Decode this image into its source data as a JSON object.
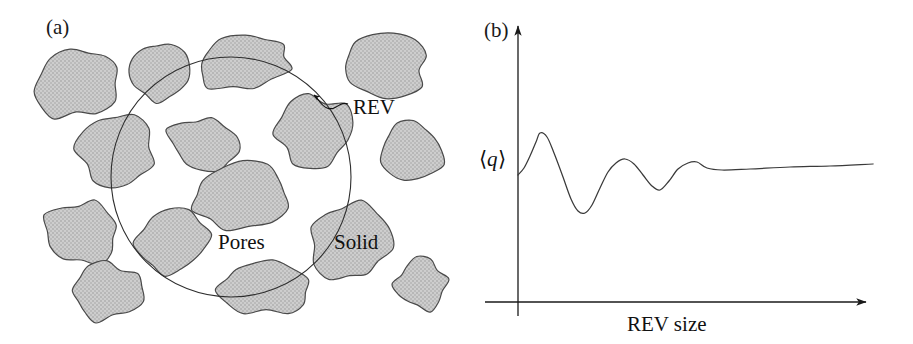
{
  "figure": {
    "background_color": "#ffffff",
    "ink_color": "#1a1a1a",
    "grain_fill_color": "#c9c9c9",
    "grain_stroke_color": "#4a4a4a"
  },
  "panel_a": {
    "label": "(a)",
    "annotations": {
      "rev": "REV",
      "pores": "Pores",
      "solid": "Solid"
    },
    "rev_circle": {
      "cx": 231,
      "cy": 177,
      "r": 120
    },
    "grains": [
      {
        "id": "grain-top-left",
        "cx": 78,
        "cy": 83,
        "rx": 42,
        "ry": 33,
        "rot": -22,
        "seed": 1
      },
      {
        "id": "grain-top-mid-left",
        "cx": 160,
        "cy": 73,
        "rx": 31,
        "ry": 29,
        "rot": 14,
        "seed": 2
      },
      {
        "id": "grain-top-center",
        "cx": 244,
        "cy": 63,
        "rx": 46,
        "ry": 26,
        "rot": -9,
        "seed": 3
      },
      {
        "id": "grain-top-right",
        "cx": 384,
        "cy": 66,
        "rx": 43,
        "ry": 32,
        "rot": 7,
        "seed": 4
      },
      {
        "id": "grain-inner-upper",
        "cx": 202,
        "cy": 144,
        "rx": 34,
        "ry": 26,
        "rot": 11,
        "seed": 5
      },
      {
        "id": "grain-inner-right",
        "cx": 314,
        "cy": 133,
        "rx": 38,
        "ry": 37,
        "rot": -15,
        "seed": 6
      },
      {
        "id": "grain-left-mid",
        "cx": 117,
        "cy": 152,
        "rx": 39,
        "ry": 38,
        "rot": 18,
        "seed": 7
      },
      {
        "id": "grain-far-right-mid",
        "cx": 412,
        "cy": 152,
        "rx": 31,
        "ry": 29,
        "rot": -5,
        "seed": 8
      },
      {
        "id": "grain-center-large",
        "cx": 240,
        "cy": 197,
        "rx": 50,
        "ry": 33,
        "rot": -6,
        "seed": 9
      },
      {
        "id": "grain-left-lower",
        "cx": 83,
        "cy": 232,
        "rx": 37,
        "ry": 31,
        "rot": 12,
        "seed": 10
      },
      {
        "id": "grain-inner-lower-left",
        "cx": 172,
        "cy": 243,
        "rx": 36,
        "ry": 31,
        "rot": -12,
        "seed": 11
      },
      {
        "id": "grain-solid-right",
        "cx": 350,
        "cy": 242,
        "rx": 41,
        "ry": 39,
        "rot": 8,
        "seed": 12
      },
      {
        "id": "grain-bottom-left",
        "cx": 106,
        "cy": 292,
        "rx": 36,
        "ry": 28,
        "rot": -8,
        "seed": 13
      },
      {
        "id": "grain-bottom-center",
        "cx": 264,
        "cy": 288,
        "rx": 44,
        "ry": 26,
        "rot": 6,
        "seed": 14
      },
      {
        "id": "grain-bottom-right",
        "cx": 420,
        "cy": 285,
        "rx": 26,
        "ry": 25,
        "rot": 15,
        "seed": 15
      }
    ],
    "rev_leader": {
      "text_x": 353,
      "text_y": 114,
      "path": "M 348 104 C 340 100, 336 112, 327 108 C 320 105, 318 98, 314 95",
      "arrow_at": [
        314,
        95
      ]
    }
  },
  "panel_b": {
    "label": "(b)",
    "y_axis_label": "q",
    "y_axis_label_full": "⟨q⟩",
    "x_axis_label": "REV size",
    "axes": {
      "origin_x": 518,
      "origin_y": 302,
      "y_axis_top": 20,
      "y_axis_bottom": 316,
      "x_axis_left": 485,
      "x_axis_right": 873
    }
  },
  "chart_data": {
    "type": "line",
    "title": "",
    "xlabel": "REV size",
    "ylabel": "⟨q⟩",
    "grid": false,
    "legend": null,
    "xlim": [
      0,
      100
    ],
    "ylim": [
      0,
      100
    ],
    "y_reference_value": 52,
    "x": [
      0,
      2,
      4,
      6,
      8,
      11,
      14,
      17,
      20,
      23,
      26,
      29,
      32,
      35,
      38,
      42,
      46,
      50,
      54,
      58,
      62,
      66,
      70,
      74,
      78,
      82,
      86,
      90,
      94,
      100
    ],
    "y": [
      52,
      58,
      66,
      74,
      79,
      77,
      68,
      55,
      42,
      33,
      30,
      34,
      44,
      54,
      60,
      62,
      59,
      52,
      46,
      43,
      47,
      55,
      60,
      61,
      57,
      53,
      53,
      54,
      55,
      56
    ],
    "points_px": [
      [
        518,
        175
      ],
      [
        524,
        168
      ],
      [
        530,
        156
      ],
      [
        536,
        142
      ],
      [
        540,
        133
      ],
      [
        547,
        137
      ],
      [
        554,
        153
      ],
      [
        563,
        177
      ],
      [
        571,
        199
      ],
      [
        578,
        211
      ],
      [
        585,
        213
      ],
      [
        592,
        205
      ],
      [
        600,
        188
      ],
      [
        608,
        172
      ],
      [
        616,
        163
      ],
      [
        625,
        159
      ],
      [
        634,
        164
      ],
      [
        643,
        175
      ],
      [
        652,
        186
      ],
      [
        660,
        190
      ],
      [
        669,
        181
      ],
      [
        678,
        169
      ],
      [
        688,
        163
      ],
      [
        697,
        162
      ],
      [
        707,
        168
      ],
      [
        722,
        170
      ],
      [
        750,
        169
      ],
      [
        790,
        167
      ],
      [
        830,
        166
      ],
      [
        873,
        164
      ]
    ],
    "features": {
      "start": [
        518,
        175
      ],
      "peak_1": [
        540,
        133
      ],
      "trough_1": [
        578,
        212
      ],
      "peak_2": [
        627,
        158
      ],
      "trough_2": [
        660,
        190
      ],
      "peak_3": [
        695,
        162
      ],
      "plateau_y": 167
    }
  }
}
